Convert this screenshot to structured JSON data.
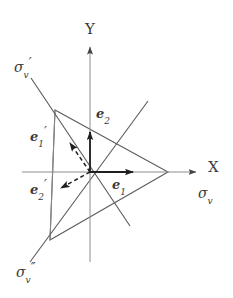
{
  "figure": {
    "type": "vector-diagram",
    "width": 233,
    "height": 298,
    "background_color": "#ffffff",
    "line_color": "#555555",
    "text_color": "#3a3a3a",
    "axes": {
      "origin": {
        "x": 90,
        "y": 172
      },
      "x_axis": {
        "label": "X",
        "label_x": 210,
        "label_y": 163,
        "from": {
          "x": 22,
          "y": 172
        },
        "to": {
          "x": 198,
          "y": 172
        },
        "arrow": true
      },
      "y_axis": {
        "label": "Y",
        "label_x": 88,
        "label_y": 23,
        "from": {
          "x": 90,
          "y": 262
        },
        "to": {
          "x": 90,
          "y": 45
        },
        "arrow": true
      }
    },
    "labels": [
      {
        "name": "sigma-v-label",
        "base": "σ",
        "subscript": "v",
        "primes": "",
        "x": 199,
        "y": 190
      },
      {
        "name": "sigma-v-prime-label",
        "base": "σ",
        "subscript": "v",
        "primes": "′",
        "x": 15,
        "y": 63
      },
      {
        "name": "sigma-v-double-prime-label",
        "base": "σ",
        "subscript": "v",
        "primes": "″",
        "x": 17,
        "y": 268
      }
    ],
    "vectors": [
      {
        "name": "e1-vector",
        "label_base": "e",
        "label_sub": "1",
        "label_primes": "",
        "style": "solid",
        "from": {
          "x": 90,
          "y": 172
        },
        "to": {
          "x": 135,
          "y": 172
        },
        "label_x": 113,
        "label_y": 182
      },
      {
        "name": "e2-vector",
        "label_base": "e",
        "label_sub": "2",
        "label_primes": "",
        "style": "solid",
        "from": {
          "x": 90,
          "y": 172
        },
        "to": {
          "x": 90,
          "y": 130
        },
        "label_x": 97,
        "label_y": 111
      },
      {
        "name": "e1-prime-vector",
        "label_base": "e",
        "label_sub": "1",
        "label_primes": "′",
        "style": "dashed",
        "from": {
          "x": 90,
          "y": 172
        },
        "to": {
          "x": 69,
          "y": 141
        },
        "label_x": 31,
        "label_y": 134
      },
      {
        "name": "e2-prime-vector",
        "label_base": "e",
        "label_sub": "2",
        "label_primes": "′",
        "style": "dashed",
        "from": {
          "x": 90,
          "y": 172
        },
        "to": {
          "x": 58,
          "y": 189
        },
        "label_x": 31,
        "label_y": 187
      }
    ],
    "triangle": {
      "name": "yield-surface-triangle",
      "vertices": [
        {
          "x": 55,
          "y": 110
        },
        {
          "x": 168,
          "y": 172
        },
        {
          "x": 50,
          "y": 240
        }
      ]
    },
    "construction_lines": [
      {
        "name": "sigma-v-prime-axis-line",
        "from": {
          "x": 31,
          "y": 78
        },
        "to": {
          "x": 130,
          "y": 226
        }
      },
      {
        "name": "sigma-v-double-prime-axis-line",
        "from": {
          "x": 30,
          "y": 262
        },
        "to": {
          "x": 148,
          "y": 101
        }
      },
      {
        "name": "left-vertical-chord",
        "from": {
          "x": 55,
          "y": 110
        },
        "to": {
          "x": 50,
          "y": 240
        }
      }
    ]
  }
}
